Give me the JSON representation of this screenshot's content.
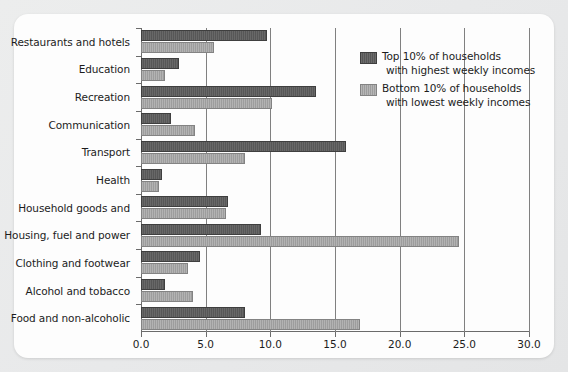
{
  "chart_data": {
    "type": "bar",
    "orientation": "horizontal",
    "title": "",
    "subtitle": "",
    "xlabel": "",
    "ylabel": "",
    "xlim": [
      0.0,
      30.0
    ],
    "xticks": [
      "0.0",
      "5.0",
      "10.0",
      "15.0",
      "20.0",
      "25.0",
      "30.0"
    ],
    "xtick_values": [
      0.0,
      5.0,
      10.0,
      15.0,
      20.0,
      25.0,
      30.0
    ],
    "grid": "vertical",
    "legend_position": "upper-right-inside",
    "categories": [
      "Restaurants and hotels",
      "Education",
      "Recreation",
      "Communication",
      "Transport",
      "Health",
      "Household goods and",
      "Housing, fuel and power",
      "Clothing and footwear",
      "Alcohol and tobacco",
      "Food and non-alcoholic"
    ],
    "series": [
      {
        "name": "Top 10% of households with highest weekly incomes",
        "legend_line1": "Top 10% of households",
        "legend_line2": "with highest weekly incomes",
        "color": "#575757",
        "values": [
          9.6,
          2.8,
          13.4,
          2.2,
          15.7,
          1.5,
          6.6,
          9.1,
          4.4,
          1.7,
          7.9
        ]
      },
      {
        "name": "Bottom 10% of households with lowest weekly incomes",
        "legend_line1": "Bottom 10% of households",
        "legend_line2": "with lowest weekly incomes",
        "color": "#9d9d9d",
        "values": [
          5.5,
          1.7,
          10.0,
          4.0,
          7.9,
          1.2,
          6.4,
          24.4,
          3.5,
          3.9,
          16.8
        ]
      }
    ]
  }
}
